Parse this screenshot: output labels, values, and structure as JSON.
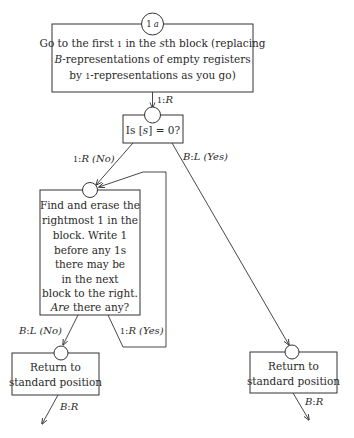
{
  "diagram": {
    "start_node": {
      "label_num": "1",
      "label_var": "a"
    },
    "box_top": {
      "lines": [
        "Go to the first 1 in the sth block (replacing",
        "B-representations of empty registers",
        "by 1-representations as you go)"
      ],
      "line1": {
        "pre": "Go to the first ",
        "one": "1",
        "mid": " in the ",
        "s": "s",
        "post": "th block (replacing"
      },
      "line2": {
        "b": "B",
        "post": "-representations of empty registers"
      },
      "line3": {
        "pre": "by ",
        "one": "1",
        "post": "-representations as you go)"
      }
    },
    "edge_top_to_decision": {
      "sym": "1",
      "sep": ":",
      "dir": "R"
    },
    "box_decision": {
      "pre": "Is [",
      "var": "s",
      "post": "] = 0?"
    },
    "edge_decision_no": {
      "sym": "1",
      "sep": ":",
      "dir": "R",
      "cond": "(No)"
    },
    "edge_decision_yes": {
      "sym": "B",
      "sep": ":",
      "dir": "L",
      "cond": "(Yes)"
    },
    "box_loop": {
      "lines": [
        "Find and erase the",
        "rightmost 1 in the",
        "block. Write 1",
        "before any 1s",
        "there may be",
        "in the next",
        "block to the right.",
        "Are there any?"
      ],
      "last_italic": "Are",
      "last_rest": " there any?"
    },
    "edge_loop_no": {
      "sym": "B",
      "sep": ":",
      "dir": "L",
      "cond": "(No)"
    },
    "edge_loop_yes": {
      "sym": "1",
      "sep": ":",
      "dir": "R",
      "cond": "(Yes)"
    },
    "box_return_left": {
      "lines": [
        "Return to",
        "standard position"
      ]
    },
    "box_return_right": {
      "lines": [
        "Return to",
        "standard position"
      ]
    },
    "edge_exit_left": {
      "sym": "B",
      "sep": ":",
      "dir": "R"
    },
    "edge_exit_right": {
      "sym": "B",
      "sep": ":",
      "dir": "R"
    },
    "colors": {
      "stroke": "#333333",
      "text": "#2a2a2a",
      "background": "#ffffff"
    }
  }
}
